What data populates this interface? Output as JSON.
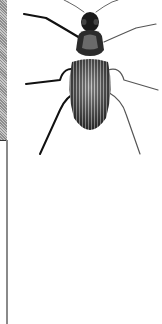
{
  "image": {
    "subject": "beetle-engraving",
    "description": "Black-and-white engraved illustration of a ground beetle (carabid) seen from above",
    "colors": {
      "ink": "#111111",
      "paper": "#ffffff",
      "strip": "#a8a8a8",
      "rule": "#8a8a8a"
    }
  }
}
